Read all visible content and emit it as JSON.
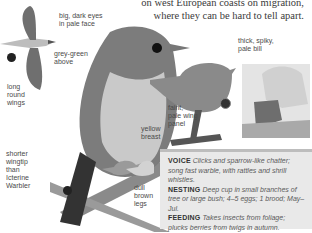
{
  "intro_text": {
    "line1": "on west European coasts on migration,",
    "line2": "where they can be hard to tell apart."
  },
  "labels": {
    "eyes": [
      "big, dark eyes",
      "in pale face"
    ],
    "upperparts": [
      "grey-green",
      "above"
    ],
    "wings": [
      "long",
      "round",
      "wings"
    ],
    "bill": [
      "thick, spiky,",
      "pale bill"
    ],
    "wing_panel": [
      "faint,",
      "pale wing",
      "panel"
    ],
    "breast": [
      "yellow",
      "breast"
    ],
    "wingtip": [
      "shorter",
      "wingtip",
      "than",
      "Icterine",
      "Warbler"
    ],
    "legs": [
      "dull",
      "brown",
      "legs"
    ]
  },
  "info": {
    "voice": {
      "key": "VOICE",
      "value": "Clicks and sparrow-like chatter; song fast warble, with rattles and shrill whistles."
    },
    "nesting": {
      "key": "NESTING",
      "value": "Deep cup in small branches of tree or large bush; 4–5 eggs; 1 brood; May–Jul."
    },
    "feeding": {
      "key": "FEEDING",
      "value": "Takes insects from foliage; plucks berries from twigs in autumn."
    },
    "similar": {
      "key": "SIMILAR SPECIES",
      "value": "Icterine Warbler, Willow Warbler, Garden Warbler."
    }
  },
  "icons": [
    "flight-symbol-icon",
    "male-female-symbol-icon",
    "season-symbol-icon"
  ],
  "colors": {
    "box_bg": "#e9e9e9",
    "box_border": "#bdbdbd",
    "text": "#3a3a3a",
    "map_range": "#6e6e6e"
  }
}
